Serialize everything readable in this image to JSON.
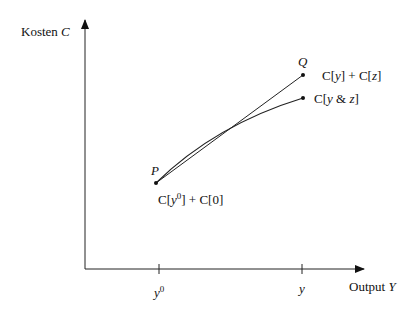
{
  "diagram": {
    "y_axis_label": {
      "text": "Kosten ",
      "var": "C"
    },
    "x_axis_label": {
      "text": "Output ",
      "var": "Y"
    },
    "x_ticks": [
      {
        "base": "y",
        "sup": "0",
        "x": 159
      },
      {
        "base": "y",
        "sup": "",
        "x": 302
      }
    ],
    "points": {
      "P": {
        "label": "P",
        "x": 156,
        "y": 183,
        "annotation": "C[y⁰] + C[0]"
      },
      "Q": {
        "label": "Q",
        "x": 303,
        "y": 75,
        "annotation": "C[y] + C[z]"
      },
      "R": {
        "label": "",
        "x": 303,
        "y": 98,
        "annotation": "C[y & z]"
      }
    },
    "lines": [
      {
        "name": "separate-cost-line",
        "from": "P",
        "to": "Q",
        "type": "straight"
      },
      {
        "name": "joint-cost-curve",
        "from": "P",
        "to": "R",
        "type": "concave-curve"
      }
    ]
  }
}
